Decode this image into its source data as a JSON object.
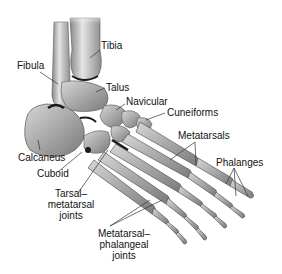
{
  "diagram": {
    "labels": {
      "tibia": "Tibia",
      "fibula": "Fibula",
      "talus": "Talus",
      "navicular": "Navicular",
      "cuneiforms": "Cuneiforms",
      "metatarsals": "Metatarsals",
      "phalanges": "Phalanges",
      "calcaneus": "Calcaneus",
      "cuboid": "Cuboid",
      "tarsal_metatarsal_joints": [
        "Tarsal–",
        "metatarsal",
        "joints"
      ],
      "metatarsal_phalangeal_joints": [
        "Metatarsal–",
        "phalangeal",
        "joints"
      ]
    },
    "colors": {
      "background": "#ffffff",
      "bone_light": "#c8c8c8",
      "bone_mid": "#9a9a9a",
      "bone_dark": "#5a5a5a",
      "joint_shadow": "#1a1a1a",
      "leader_line": "#333333",
      "text": "#111111"
    }
  }
}
